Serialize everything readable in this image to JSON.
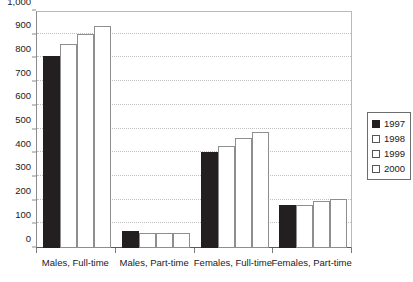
{
  "chart_data": {
    "type": "bar",
    "title": "",
    "xlabel": "",
    "ylabel": "",
    "ylim": [
      0,
      1000
    ],
    "grid": true,
    "legend_position": "right",
    "categories": [
      "Males, Full-time",
      "Males, Part-time",
      "Females, Full-time",
      "Females, Part-time"
    ],
    "y_ticks": [
      "0",
      "100",
      "200",
      "300",
      "400",
      "500",
      "600",
      "700",
      "800",
      "900",
      "1,000"
    ],
    "y_tick_values": [
      0,
      100,
      200,
      300,
      400,
      500,
      600,
      700,
      800,
      900,
      1000
    ],
    "series": [
      {
        "name": "1997",
        "style": "filled",
        "color": "#231f20",
        "values": [
          810,
          70,
          405,
          180
        ]
      },
      {
        "name": "1998",
        "style": "hollow",
        "color": "#ffffff",
        "values": [
          860,
          65,
          430,
          182
        ]
      },
      {
        "name": "1999",
        "style": "hollow",
        "color": "#ffffff",
        "values": [
          905,
          65,
          465,
          198
        ]
      },
      {
        "name": "2000",
        "style": "hollow",
        "color": "#ffffff",
        "values": [
          935,
          65,
          490,
          208
        ]
      }
    ]
  },
  "legend": {
    "entries": [
      {
        "label": "1997",
        "style": "filled"
      },
      {
        "label": "1998",
        "style": "hollow"
      },
      {
        "label": "1999",
        "style": "hollow"
      },
      {
        "label": "2000",
        "style": "hollow"
      }
    ]
  }
}
